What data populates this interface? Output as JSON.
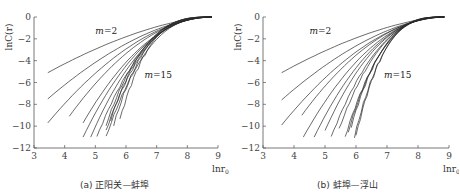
{
  "chart_data": [
    {
      "type": "line",
      "title": "",
      "caption": "(a) 正阳关—蚌埠",
      "xlabel": "lnr0",
      "ylabel": "lnC(r)",
      "xlim": [
        3,
        9
      ],
      "ylim": [
        -12,
        0
      ],
      "xticks": [
        3,
        4,
        5,
        6,
        7,
        8,
        9
      ],
      "yticks": [
        0,
        -2,
        -4,
        -6,
        -8,
        -10,
        -12
      ],
      "grid": false,
      "legend": "none",
      "annotations": [
        {
          "text": "m=2",
          "x": 5.0,
          "y": -1.6
        },
        {
          "text": "m=15",
          "x": 6.6,
          "y": -5.6
        }
      ],
      "series": [
        {
          "name": "m=2",
          "x_start": 3.45,
          "y_start": -5.1
        },
        {
          "name": "m=3",
          "x_start": 3.45,
          "y_start": -7.5
        },
        {
          "name": "m=4",
          "x_start": 3.45,
          "y_start": -9.7
        },
        {
          "name": "m=5",
          "x_start": 4.15,
          "y_start": -9.1
        },
        {
          "name": "m=6",
          "x_start": 4.6,
          "y_start": -9.7
        },
        {
          "name": "m=7",
          "x_start": 4.6,
          "y_start": -11.0
        },
        {
          "name": "m=8",
          "x_start": 4.85,
          "y_start": -11.0
        },
        {
          "name": "m=9",
          "x_start": 5.05,
          "y_start": -11.0
        },
        {
          "name": "m=10",
          "x_start": 5.35,
          "y_start": -11.0
        },
        {
          "name": "m=11",
          "x_start": 5.35,
          "y_start": -10.4
        },
        {
          "name": "m=12",
          "x_start": 5.35,
          "y_start": -9.9
        },
        {
          "name": "m=13",
          "x_start": 5.5,
          "y_start": -9.4
        },
        {
          "name": "m=14",
          "x_start": 5.6,
          "y_start": -9.9
        },
        {
          "name": "m=15",
          "x_start": 5.8,
          "y_start": -9.4
        }
      ],
      "converge_point": {
        "x": 8.8,
        "y": 0
      }
    },
    {
      "type": "line",
      "title": "",
      "caption": "(b) 蚌埠—浮山",
      "xlabel": "lnr0",
      "ylabel": "lnC(r)",
      "xlim": [
        3,
        9
      ],
      "ylim": [
        -12,
        0
      ],
      "xticks": [
        3,
        4,
        5,
        6,
        7,
        8,
        9
      ],
      "yticks": [
        0,
        -2,
        -4,
        -6,
        -8,
        -10,
        -12
      ],
      "grid": false,
      "legend": "none",
      "annotations": [
        {
          "text": "m=2",
          "x": 4.5,
          "y": -1.6
        },
        {
          "text": "m=15",
          "x": 6.9,
          "y": -5.6
        }
      ],
      "series": [
        {
          "name": "m=2",
          "x_start": 3.6,
          "y_start": -5.1
        },
        {
          "name": "m=3",
          "x_start": 3.6,
          "y_start": -7.6
        },
        {
          "name": "m=4",
          "x_start": 3.6,
          "y_start": -9.9
        },
        {
          "name": "m=5",
          "x_start": 4.25,
          "y_start": -9.0
        },
        {
          "name": "m=6",
          "x_start": 4.3,
          "y_start": -11.0
        },
        {
          "name": "m=7",
          "x_start": 4.65,
          "y_start": -11.0
        },
        {
          "name": "m=8",
          "x_start": 5.0,
          "y_start": -10.4
        },
        {
          "name": "m=9",
          "x_start": 5.2,
          "y_start": -11.0
        },
        {
          "name": "m=10",
          "x_start": 5.45,
          "y_start": -10.3
        },
        {
          "name": "m=11",
          "x_start": 5.65,
          "y_start": -11.0
        },
        {
          "name": "m=12",
          "x_start": 5.75,
          "y_start": -10.5
        },
        {
          "name": "m=13",
          "x_start": 5.85,
          "y_start": -10.0
        },
        {
          "name": "m=14",
          "x_start": 5.95,
          "y_start": -11.0
        },
        {
          "name": "m=15",
          "x_start": 6.0,
          "y_start": -10.9
        }
      ],
      "converge_point": {
        "x": 8.85,
        "y": 0
      }
    }
  ],
  "panels": [
    {
      "caption": "(a) 正阳关—蚌埠",
      "ylabel": "lnC(r)",
      "xlabel": "lnr",
      "xlabel_sub": "0",
      "annot_low": "m=2",
      "annot_high": "m=15"
    },
    {
      "caption": "(b) 蚌埠—浮山",
      "ylabel": "lnC(r)",
      "xlabel": "lnr",
      "xlabel_sub": "0",
      "annot_low": "m=2",
      "annot_high": "m=15"
    }
  ],
  "colors": {
    "line": "#2a2a2a",
    "axis": "#555555",
    "text": "#333333"
  }
}
